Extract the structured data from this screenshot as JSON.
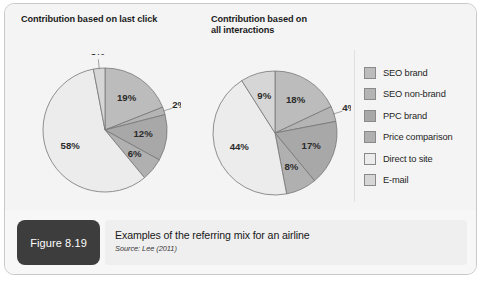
{
  "figure": {
    "tag": "Figure 8.19",
    "caption": "Examples of the referring mix for an airline",
    "source": "Source: Lee (2011)"
  },
  "legend": {
    "position": "right",
    "items": [
      {
        "label": "SEO brand",
        "color": "#bcbcbc"
      },
      {
        "label": "SEO non-brand",
        "color": "#b4b4b4"
      },
      {
        "label": "PPC brand",
        "color": "#a8a8a8"
      },
      {
        "label": "Price comparison",
        "color": "#b0b0b0"
      },
      {
        "label": "Direct to site",
        "color": "#ececec"
      },
      {
        "label": "E-mail",
        "color": "#d6d6d6"
      }
    ]
  },
  "chart_data": [
    {
      "type": "pie",
      "title": "Contribution based on last click",
      "categories": [
        "SEO brand",
        "SEO non-brand",
        "PPC brand",
        "Price comparison",
        "Direct to site",
        "E-mail"
      ],
      "values": [
        19,
        2,
        12,
        6,
        58,
        3
      ],
      "labels": [
        "19%",
        "2%",
        "12%",
        "6%",
        "58%",
        "3%"
      ],
      "colors": [
        "#bcbcbc",
        "#b4b4b4",
        "#a8a8a8",
        "#b0b0b0",
        "#ececec",
        "#d6d6d6"
      ],
      "start_angle": 0,
      "direction": "clockwise",
      "units": "percent"
    },
    {
      "type": "pie",
      "title": "Contribution based on all interactions",
      "categories": [
        "SEO brand",
        "SEO non-brand",
        "PPC brand",
        "Price comparison",
        "Direct to site",
        "E-mail"
      ],
      "values": [
        18,
        4,
        17,
        8,
        44,
        9
      ],
      "labels": [
        "18%",
        "4%",
        "17%",
        "8%",
        "44%",
        "9%"
      ],
      "colors": [
        "#bcbcbc",
        "#b4b4b4",
        "#a8a8a8",
        "#b0b0b0",
        "#ececec",
        "#d6d6d6"
      ],
      "start_angle": 0,
      "direction": "clockwise",
      "units": "percent"
    }
  ],
  "titles": {
    "pie1_line1": "Contribution based on last click",
    "pie2_line1": "Contribution based on",
    "pie2_line2": "all interactions"
  },
  "style": {
    "slice_stroke": "#767676",
    "frame_border": "#c9c9c9",
    "panel_bg": "#f4f4f4"
  }
}
